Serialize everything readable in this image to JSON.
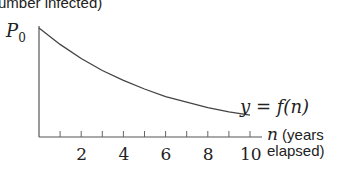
{
  "chart_data": {
    "type": "line",
    "title": "",
    "ylabel": "(number infected)",
    "xlabel": "n (years elapsed)",
    "y_start_label": "P0",
    "curve_label": "y = f(n)",
    "x_tick_labels": [
      "2",
      "4",
      "6",
      "8",
      "10"
    ],
    "x_minor_ticks": [
      1,
      2,
      3,
      4,
      5,
      6,
      7,
      8,
      9,
      10
    ],
    "xlim": [
      0,
      10
    ],
    "grid": false,
    "series": [
      {
        "name": "y = f(n)",
        "description": "decreasing exponential decay from P0",
        "x": [
          0,
          1,
          2,
          3,
          4,
          5,
          6,
          7,
          8,
          9,
          10
        ],
        "y_relative": [
          1.0,
          0.85,
          0.72,
          0.61,
          0.52,
          0.44,
          0.37,
          0.32,
          0.27,
          0.23,
          0.2
        ]
      }
    ]
  },
  "labels": {
    "ylabel": "umber infected)",
    "p0_main": "P",
    "p0_sub": "0",
    "curve": "y = f(n)",
    "x_var": "n",
    "x_unit_line1": " (years",
    "x_unit_line2": "elapsed)"
  }
}
